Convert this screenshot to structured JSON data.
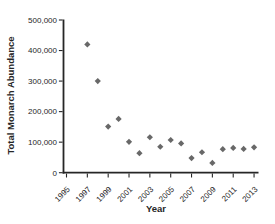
{
  "chart_data": {
    "type": "scatter",
    "title": "",
    "xlabel": "Year",
    "ylabel": "Total Monarch Abundance",
    "x": [
      1997,
      1998,
      1999,
      2000,
      2001,
      2002,
      2003,
      2004,
      2005,
      2006,
      2007,
      2008,
      2009,
      2010,
      2011,
      2012,
      2013
    ],
    "values": [
      420000,
      300000,
      151000,
      176000,
      101000,
      64000,
      116000,
      85000,
      107000,
      96000,
      48000,
      67000,
      32000,
      77000,
      81000,
      78000,
      83000
    ],
    "xticks": [
      1995,
      1997,
      1999,
      2001,
      2003,
      2005,
      2007,
      2009,
      2011,
      2013
    ],
    "xtick_labels": [
      "1995",
      "1997",
      "1999",
      "2001",
      "2003",
      "2005",
      "2007",
      "2009",
      "2011",
      "2013"
    ],
    "yticks": [
      0,
      100000,
      200000,
      300000,
      400000,
      500000
    ],
    "ytick_labels": [
      "0",
      "100,000",
      "200,000",
      "300,000",
      "400,000",
      "500,000"
    ],
    "xlim": [
      1994.7,
      2013.6
    ],
    "ylim": [
      0,
      500000
    ],
    "grid": false,
    "legend": null,
    "marker": {
      "shape": "diamond",
      "color": "#686868",
      "size": 6
    },
    "axis_color": "#262626"
  }
}
